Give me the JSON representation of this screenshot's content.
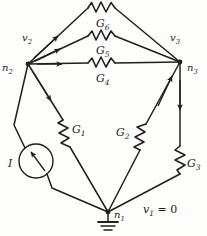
{
  "diagram": {
    "stroke_color": "#221f1c",
    "background_color": "#fdfdfb",
    "nodes": [
      {
        "id": "n1",
        "label": "n",
        "subscript": "1",
        "x": 108,
        "y": 212,
        "role": "ground-node"
      },
      {
        "id": "n2",
        "label": "n",
        "subscript": "2",
        "x": 28,
        "y": 64,
        "role": "node"
      },
      {
        "id": "n3",
        "label": "n",
        "subscript": "3",
        "x": 180,
        "y": 62,
        "role": "node"
      }
    ],
    "node_labels": [
      {
        "name": "node-label-n2",
        "text": "n",
        "sub": "2",
        "x": 4,
        "y": 62
      },
      {
        "name": "node-label-n3",
        "text": "n",
        "sub": "3",
        "x": 186,
        "y": 62
      },
      {
        "name": "node-label-n1",
        "text": "n",
        "sub": "1",
        "x": 116,
        "y": 211
      }
    ],
    "voltage_labels": [
      {
        "name": "voltage-label-v2",
        "text": "v",
        "sub": "2",
        "x": 24,
        "y": 36
      },
      {
        "name": "voltage-label-v3",
        "text": "v",
        "sub": "3",
        "x": 172,
        "y": 36
      }
    ],
    "components": [
      {
        "id": "G1",
        "label": "G",
        "subscript": "1",
        "type": "resistor",
        "x": 70,
        "y": 124,
        "between": [
          "n2",
          "n1"
        ]
      },
      {
        "id": "G2",
        "label": "G",
        "subscript": "2",
        "type": "resistor",
        "x": 124,
        "y": 127,
        "between": [
          "n1",
          "n3"
        ]
      },
      {
        "id": "G3",
        "label": "G",
        "subscript": "3",
        "type": "resistor",
        "x": 185,
        "y": 158,
        "between": [
          "n3",
          "n1"
        ]
      },
      {
        "id": "G4",
        "label": "G",
        "subscript": "4",
        "type": "resistor",
        "x": 98,
        "y": 74,
        "between": [
          "n2",
          "n3"
        ]
      },
      {
        "id": "G5",
        "label": "G",
        "subscript": "5",
        "type": "resistor",
        "x": 100,
        "y": 46,
        "between": [
          "n2",
          "n3"
        ]
      },
      {
        "id": "G6",
        "label": "G",
        "subscript": "6",
        "type": "resistor",
        "x": 100,
        "y": 18,
        "between": [
          "n2",
          "n3"
        ]
      }
    ],
    "source": {
      "id": "I",
      "label": "I",
      "type": "current-source",
      "x": 11,
      "y": 163,
      "cx": 36,
      "cy": 161,
      "r": 17
    },
    "ground": {
      "name": "ground-symbol",
      "x": 108,
      "y": 212
    },
    "equation": {
      "text": "v",
      "sub": "1",
      "rest": " = 0",
      "x": 144,
      "y": 206
    }
  }
}
